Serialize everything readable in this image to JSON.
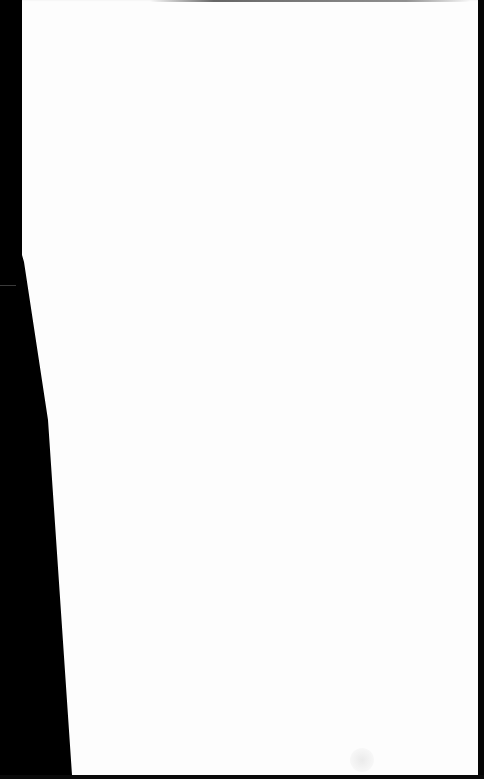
{
  "scene": {
    "description": "Blank white sheet of paper photographed on black background",
    "background_color": "#000000",
    "paper_color": "#fdfdfd",
    "text_content": []
  }
}
